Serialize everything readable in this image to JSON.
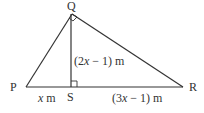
{
  "diagram": {
    "type": "right-triangle-with-altitude",
    "vertices": {
      "P": {
        "label": "P"
      },
      "Q": {
        "label": "Q"
      },
      "R": {
        "label": "R"
      },
      "S": {
        "label": "S"
      }
    },
    "labels": {
      "QS": {
        "pre": "(2",
        "var": "x",
        "post": " − 1) m"
      },
      "PS": {
        "var": "x",
        "post": " m"
      },
      "SR": {
        "pre": "(3",
        "var": "x",
        "post": " − 1) m"
      }
    },
    "right_angles": [
      "PQR",
      "QSR"
    ],
    "stroke_color": "#333333"
  }
}
